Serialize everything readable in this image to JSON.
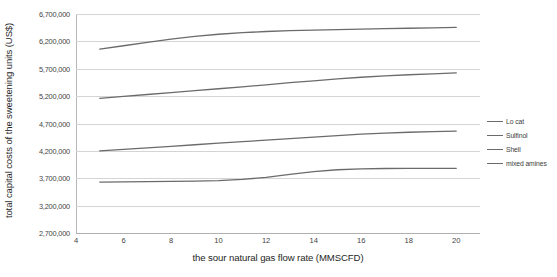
{
  "chart_data": {
    "type": "line",
    "title": "",
    "xlabel": "the sour natural gas flow rate (MMSCFD)",
    "ylabel": "total capital costs of the sweetening units (US$)",
    "xlim": [
      4,
      21
    ],
    "ylim": [
      2700000,
      6700000
    ],
    "grid": true,
    "legend_position": "right",
    "xticks": [
      4,
      6,
      8,
      10,
      12,
      14,
      16,
      18,
      20
    ],
    "xtick_labels": [
      "4",
      "6",
      "8",
      "10",
      "12",
      "14",
      "16",
      "18",
      "20"
    ],
    "yticks": [
      2700000,
      3200000,
      3700000,
      4200000,
      4700000,
      5200000,
      5700000,
      6200000,
      6700000
    ],
    "ytick_labels": [
      "2,700,000",
      "3,200,000",
      "3,700,000",
      "4,200,000",
      "4,700,000",
      "5,200,000",
      "5,700,000",
      "6,200,000",
      "6,700,000"
    ],
    "x": [
      5,
      6,
      7,
      8,
      9,
      10,
      11,
      12,
      13,
      14,
      15,
      16,
      17,
      18,
      19,
      20
    ],
    "series": [
      {
        "name": "Lo cat",
        "color": "#6b6b6b",
        "values": [
          6060000,
          6120000,
          6180000,
          6240000,
          6290000,
          6330000,
          6360000,
          6380000,
          6395000,
          6405000,
          6415000,
          6425000,
          6432000,
          6440000,
          6448000,
          6455000
        ]
      },
      {
        "name": "Sulfinol",
        "color": "#6b6b6b",
        "values": [
          5160000,
          5195000,
          5230000,
          5265000,
          5300000,
          5335000,
          5370000,
          5405000,
          5445000,
          5480000,
          5515000,
          5545000,
          5570000,
          5590000,
          5608000,
          5625000
        ]
      },
      {
        "name": "Shell",
        "color": "#6b6b6b",
        "values": [
          4200000,
          4228000,
          4256000,
          4284000,
          4312000,
          4340000,
          4368000,
          4396000,
          4424000,
          4452000,
          4480000,
          4505000,
          4525000,
          4540000,
          4552000,
          4562000
        ]
      },
      {
        "name": "mixed amines",
        "color": "#6b6b6b",
        "values": [
          3630000,
          3634000,
          3638000,
          3642000,
          3648000,
          3658000,
          3680000,
          3715000,
          3770000,
          3820000,
          3855000,
          3872000,
          3878000,
          3880000,
          3881000,
          3882000
        ]
      }
    ]
  },
  "legend": {
    "items": [
      {
        "label": "Lo cat"
      },
      {
        "label": "Sulfinol"
      },
      {
        "label": "Shell"
      },
      {
        "label": "mixed amines"
      }
    ]
  },
  "colors": {
    "line": "#6b6b6b",
    "gridline": "#d4d4d4",
    "axis": "#b0b0b0",
    "text": "#3a3a3a",
    "background": "#ffffff"
  }
}
